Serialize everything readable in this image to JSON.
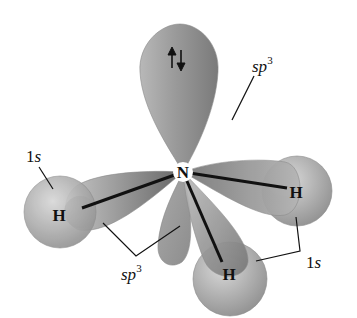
{
  "diagram": {
    "central_atom": {
      "symbol": "N",
      "x": 183,
      "y": 172
    },
    "hydrogens": [
      {
        "symbol": "H",
        "x": 60,
        "y": 214
      },
      {
        "symbol": "H",
        "x": 296,
        "y": 192
      },
      {
        "symbol": "H",
        "x": 229,
        "y": 273
      }
    ],
    "lone_pair": {
      "symbol": "↑↓",
      "description": "lone pair electrons in top sp3 lobe"
    },
    "labels": {
      "left_1s": {
        "main": "1",
        "italic": "s"
      },
      "top_sp3": {
        "italic": "sp",
        "sup": "3"
      },
      "bottom_sp3": {
        "italic": "sp",
        "sup": "3"
      },
      "right_1s": {
        "main": "1",
        "italic": "s"
      }
    },
    "colors": {
      "lobe_dark": "#6e6e6e",
      "lobe_light": "#bdbdbd",
      "sphere_dark": "#8a8a8a",
      "sphere_light": "#d0d0d0",
      "bond": "#111111",
      "text": "#111111"
    }
  }
}
